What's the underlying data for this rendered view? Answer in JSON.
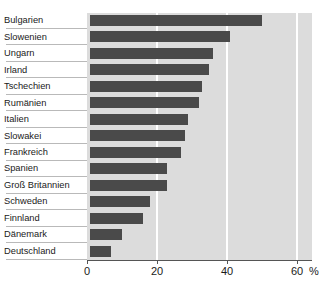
{
  "chart_data": {
    "type": "bar",
    "orientation": "horizontal",
    "title": "",
    "subtitle": "",
    "xlabel": "",
    "ylabel": "",
    "unit_label": "%",
    "xlim": [
      0,
      60
    ],
    "xticks": [
      0,
      20,
      40,
      60
    ],
    "xtick_labels": [
      "0",
      "20",
      "40",
      "60"
    ],
    "grid": true,
    "gridline_values": [
      20,
      40,
      60
    ],
    "legend": null,
    "categories": [
      "Bulgarien",
      "Slowenien",
      "Ungarn",
      "Irland",
      "Tschechien",
      "Rumänien",
      "Italien",
      "Slowakei",
      "Frankreich",
      "Spanien",
      "Groß Britannien",
      "Schweden",
      "Finnland",
      "Dänemark",
      "Deutschland"
    ],
    "values": [
      49,
      40,
      35,
      34,
      32,
      31,
      28,
      27,
      26,
      22,
      22,
      17,
      15,
      9,
      6
    ],
    "colors": {
      "bar": "#4a4a4a",
      "plot_background": "#dcdcdc",
      "gridline": "#ffffff",
      "axis": "#555555",
      "text": "#1a1a1a",
      "leader_line": "#b9b9b9",
      "page_background": "#ffffff"
    }
  }
}
